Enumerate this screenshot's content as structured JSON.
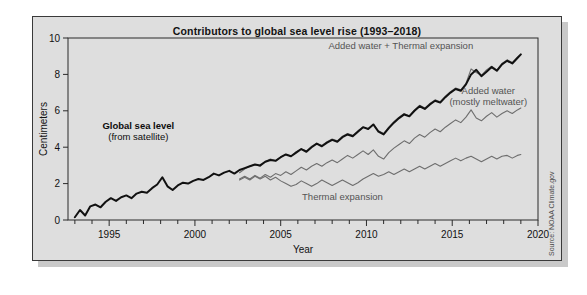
{
  "figure": {
    "title": "Contributors to global sea level rise (1993–2018)",
    "source_credit": "Source: NOAA Climate.gov",
    "background_color": "#dedede",
    "frame_color": "#3a3a3a"
  },
  "chart_data": {
    "type": "line",
    "title": "Contributors to global sea level rise (1993–2018)",
    "xlabel": "Year",
    "ylabel": "Centimeters",
    "xlim": [
      1992.6,
      2020.0
    ],
    "ylim": [
      0,
      10
    ],
    "xticks": [
      1995,
      2000,
      2005,
      2010,
      2015,
      2020
    ],
    "xtick_labels": [
      "1995",
      "2000",
      "2005",
      "2010",
      "2015",
      "2020"
    ],
    "xminor_step": 1,
    "yticks": [
      0,
      2,
      4,
      6,
      8,
      10
    ],
    "ytick_labels": [
      "0",
      "2",
      "4",
      "6",
      "8",
      "10"
    ],
    "grid": false,
    "legend_position": "inline-annotations",
    "series": [
      {
        "name": "Global sea level (from satellite)",
        "color": "#111111",
        "width": 2.0,
        "x": [
          1993.0,
          1993.3,
          1993.6,
          1993.9,
          1994.2,
          1994.5,
          1994.8,
          1995.1,
          1995.4,
          1995.7,
          1996.0,
          1996.3,
          1996.6,
          1996.9,
          1997.2,
          1997.5,
          1997.8,
          1998.1,
          1998.4,
          1998.7,
          1999.0,
          1999.3,
          1999.6,
          1999.9,
          2000.2,
          2000.5,
          2000.8,
          2001.1,
          2001.4,
          2001.7,
          2002.0,
          2002.3,
          2002.6,
          2002.9,
          2003.2,
          2003.5,
          2003.8,
          2004.1,
          2004.4,
          2004.7,
          2005.0,
          2005.3,
          2005.6,
          2005.9,
          2006.2,
          2006.5,
          2006.8,
          2007.1,
          2007.4,
          2007.7,
          2008.0,
          2008.3,
          2008.6,
          2008.9,
          2009.2,
          2009.5,
          2009.8,
          2010.1,
          2010.4,
          2010.7,
          2011.0,
          2011.3,
          2011.6,
          2011.9,
          2012.2,
          2012.5,
          2012.8,
          2013.1,
          2013.4,
          2013.7,
          2014.0,
          2014.3,
          2014.6,
          2014.9,
          2015.2,
          2015.5,
          2015.8,
          2016.1,
          2016.4,
          2016.7,
          2017.0,
          2017.3,
          2017.6,
          2017.9,
          2018.2,
          2018.5,
          2018.8,
          2019.0
        ],
        "y": [
          0.15,
          0.55,
          0.25,
          0.75,
          0.85,
          0.7,
          1.0,
          1.2,
          1.05,
          1.25,
          1.35,
          1.2,
          1.45,
          1.55,
          1.5,
          1.75,
          1.95,
          2.35,
          1.85,
          1.65,
          1.9,
          2.05,
          2.0,
          2.15,
          2.25,
          2.2,
          2.35,
          2.55,
          2.45,
          2.6,
          2.7,
          2.55,
          2.75,
          2.85,
          2.95,
          3.05,
          3.0,
          3.2,
          3.3,
          3.25,
          3.45,
          3.6,
          3.5,
          3.7,
          3.9,
          3.75,
          4.0,
          4.2,
          4.05,
          4.25,
          4.4,
          4.3,
          4.55,
          4.7,
          4.6,
          4.85,
          5.1,
          5.0,
          5.25,
          4.85,
          4.7,
          5.05,
          5.35,
          5.6,
          5.8,
          5.7,
          6.0,
          6.25,
          6.1,
          6.35,
          6.55,
          6.45,
          6.75,
          7.0,
          7.2,
          7.1,
          7.45,
          8.0,
          8.25,
          7.9,
          8.15,
          8.4,
          8.2,
          8.55,
          8.75,
          8.6,
          8.9,
          9.1
        ]
      },
      {
        "name": "Added water + Thermal expansion",
        "color": "#6e6e6e",
        "width": 1.1,
        "x": [
          2002.6,
          2002.9,
          2003.2,
          2003.5,
          2003.8,
          2004.1,
          2004.4,
          2004.7,
          2005.0,
          2005.3,
          2005.6,
          2005.9,
          2006.2,
          2006.5,
          2006.8,
          2007.1,
          2007.4,
          2007.7,
          2008.0,
          2008.3,
          2008.6,
          2008.9,
          2009.2,
          2009.5,
          2009.8,
          2010.1,
          2010.4,
          2010.7,
          2011.0,
          2011.3,
          2011.6,
          2011.9,
          2012.2,
          2012.5,
          2012.8,
          2013.1,
          2013.4,
          2013.7,
          2014.0,
          2014.3,
          2014.6,
          2014.9,
          2015.2,
          2015.5,
          2015.8,
          2016.1,
          2016.4,
          2016.7,
          2017.0,
          2017.3,
          2017.6,
          2017.9,
          2018.2,
          2018.5,
          2018.8,
          2019.0
        ],
        "y": [
          2.6,
          2.8,
          2.95,
          3.05,
          2.95,
          3.2,
          3.35,
          3.25,
          3.45,
          3.6,
          3.5,
          3.75,
          3.9,
          3.8,
          4.05,
          4.2,
          4.1,
          4.3,
          4.45,
          4.35,
          4.6,
          4.75,
          4.65,
          4.9,
          5.1,
          5.0,
          5.25,
          4.9,
          4.75,
          5.1,
          5.4,
          5.65,
          5.85,
          5.7,
          6.05,
          6.3,
          6.15,
          6.4,
          6.6,
          6.5,
          6.8,
          7.05,
          7.25,
          7.15,
          7.5,
          8.3,
          8.1,
          7.95,
          8.25,
          8.45,
          8.25,
          8.6,
          8.8,
          8.65,
          8.95,
          9.1
        ]
      },
      {
        "name": "Added water (mostly meltwater)",
        "color": "#6e6e6e",
        "width": 1.1,
        "x": [
          2002.6,
          2002.9,
          2003.2,
          2003.5,
          2003.8,
          2004.1,
          2004.4,
          2004.7,
          2005.0,
          2005.3,
          2005.6,
          2005.9,
          2006.2,
          2006.5,
          2006.8,
          2007.1,
          2007.4,
          2007.7,
          2008.0,
          2008.3,
          2008.6,
          2008.9,
          2009.2,
          2009.5,
          2009.8,
          2010.1,
          2010.4,
          2010.7,
          2011.0,
          2011.3,
          2011.6,
          2011.9,
          2012.2,
          2012.5,
          2012.8,
          2013.1,
          2013.4,
          2013.7,
          2014.0,
          2014.3,
          2014.6,
          2014.9,
          2015.2,
          2015.5,
          2015.8,
          2016.1,
          2016.4,
          2016.7,
          2017.0,
          2017.3,
          2017.6,
          2017.9,
          2018.2,
          2018.5,
          2018.8,
          2019.0
        ],
        "y": [
          2.25,
          2.4,
          2.25,
          2.45,
          2.3,
          2.5,
          2.35,
          2.55,
          2.45,
          2.65,
          2.5,
          2.7,
          2.9,
          2.75,
          2.95,
          3.1,
          2.95,
          3.15,
          3.3,
          3.15,
          3.35,
          3.55,
          3.4,
          3.6,
          3.8,
          3.6,
          3.85,
          3.5,
          3.35,
          3.7,
          3.95,
          4.15,
          4.35,
          4.2,
          4.5,
          4.7,
          4.55,
          4.8,
          5.0,
          4.85,
          5.1,
          5.3,
          5.5,
          5.35,
          5.65,
          6.05,
          5.6,
          5.45,
          5.7,
          5.9,
          5.65,
          5.85,
          6.0,
          5.85,
          6.05,
          6.15
        ]
      },
      {
        "name": "Thermal expansion",
        "color": "#6e6e6e",
        "width": 1.1,
        "x": [
          2002.6,
          2002.9,
          2003.2,
          2003.5,
          2003.8,
          2004.1,
          2004.4,
          2004.7,
          2005.0,
          2005.3,
          2005.6,
          2005.9,
          2006.2,
          2006.5,
          2006.8,
          2007.1,
          2007.4,
          2007.7,
          2008.0,
          2008.3,
          2008.6,
          2008.9,
          2009.2,
          2009.5,
          2009.8,
          2010.1,
          2010.4,
          2010.7,
          2011.0,
          2011.3,
          2011.6,
          2011.9,
          2012.2,
          2012.5,
          2012.8,
          2013.1,
          2013.4,
          2013.7,
          2014.0,
          2014.3,
          2014.6,
          2014.9,
          2015.2,
          2015.5,
          2015.8,
          2016.1,
          2016.4,
          2016.7,
          2017.0,
          2017.3,
          2017.6,
          2017.9,
          2018.2,
          2018.5,
          2018.8,
          2019.0
        ],
        "y": [
          2.2,
          2.35,
          2.2,
          2.4,
          2.25,
          2.4,
          2.2,
          2.35,
          2.15,
          2.0,
          1.85,
          1.95,
          2.15,
          2.0,
          1.85,
          2.0,
          2.2,
          2.05,
          1.9,
          2.05,
          2.2,
          2.05,
          1.9,
          2.05,
          2.25,
          2.4,
          2.55,
          2.4,
          2.5,
          2.65,
          2.5,
          2.65,
          2.8,
          2.65,
          2.8,
          2.95,
          2.8,
          2.95,
          3.1,
          2.95,
          3.1,
          3.25,
          3.4,
          3.25,
          3.4,
          3.5,
          3.35,
          3.2,
          3.35,
          3.5,
          3.35,
          3.5,
          3.55,
          3.4,
          3.55,
          3.6
        ]
      }
    ],
    "annotations": [
      {
        "id": "annot-global-sea-level",
        "lines": [
          "Global sea level",
          "(from satellite)"
        ],
        "bold_first_line": true,
        "color": "#0d0d0d",
        "x": 1996.7,
        "y": 5.0
      },
      {
        "id": "annot-added-water-thermal",
        "lines": [
          "Added water + Thermal expansion"
        ],
        "bold_first_line": false,
        "color": "#545454",
        "x": 2012.0,
        "y": 9.4
      },
      {
        "id": "annot-added-water",
        "lines": [
          "Added water",
          "(mostly meltwater)"
        ],
        "bold_first_line": false,
        "color": "#545454",
        "x": 2017.1,
        "y": 6.9
      },
      {
        "id": "annot-thermal-expansion",
        "lines": [
          "Thermal expansion"
        ],
        "bold_first_line": false,
        "color": "#545454",
        "x": 2008.6,
        "y": 1.1
      }
    ]
  }
}
